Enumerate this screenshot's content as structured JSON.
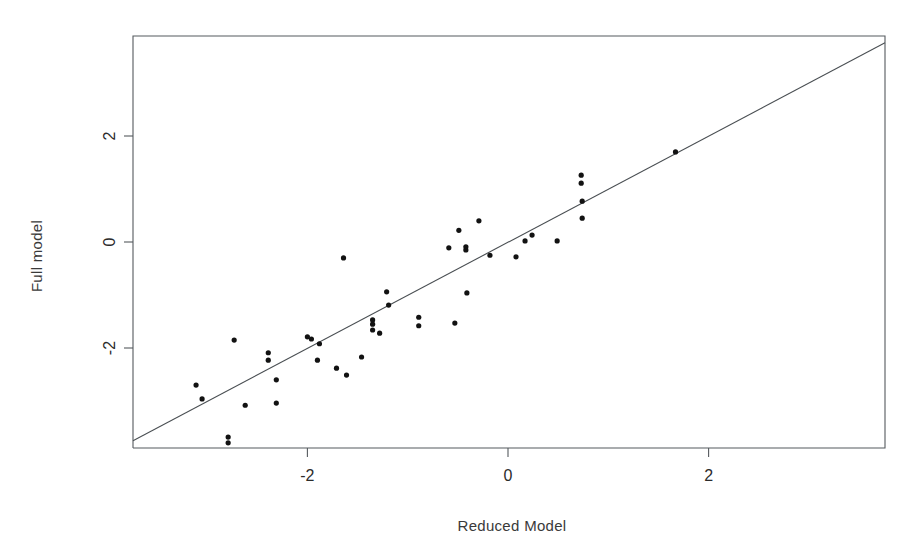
{
  "chart_data": {
    "type": "scatter",
    "title": "",
    "subtitle": "",
    "xlabel": "Reduced Model",
    "ylabel": "Full model",
    "xlim": [
      -3.75,
      3.76
    ],
    "ylim": [
      -3.79,
      3.74
    ],
    "xticks": [
      -2,
      0,
      2
    ],
    "xtick_labels": [
      "-2",
      "0",
      "2"
    ],
    "yticks": [
      -2,
      0,
      2
    ],
    "ytick_labels": [
      "-2",
      "0",
      "2"
    ],
    "grid": false,
    "legend": null,
    "annotations": [],
    "reference_line": {
      "name": "identity-line",
      "type": "line",
      "description": "y = x diagonal reference line",
      "slope": 1,
      "intercept": 0,
      "x_start": -3.75,
      "y_start": -3.75,
      "x_end": 3.76,
      "y_end": 3.76
    },
    "series": [
      {
        "name": "observations",
        "marker": "filled-circle",
        "color": "#121212",
        "points": [
          [
            -3.11,
            -2.7
          ],
          [
            -3.05,
            -2.96
          ],
          [
            -2.73,
            -1.85
          ],
          [
            -2.79,
            -3.68
          ],
          [
            -2.79,
            -3.79
          ],
          [
            -2.62,
            -3.08
          ],
          [
            -2.39,
            -2.09
          ],
          [
            -2.39,
            -2.23
          ],
          [
            -2.31,
            -2.6
          ],
          [
            -2.31,
            -3.04
          ],
          [
            -2.0,
            -1.79
          ],
          [
            -1.96,
            -1.83
          ],
          [
            -1.88,
            -1.92
          ],
          [
            -1.9,
            -2.23
          ],
          [
            -1.71,
            -2.38
          ],
          [
            -1.61,
            -2.51
          ],
          [
            -1.64,
            -0.3
          ],
          [
            -1.46,
            -2.17
          ],
          [
            -1.35,
            -1.47
          ],
          [
            -1.35,
            -1.55
          ],
          [
            -1.35,
            -1.66
          ],
          [
            -1.28,
            -1.72
          ],
          [
            -1.21,
            -0.94
          ],
          [
            -1.19,
            -1.19
          ],
          [
            -0.89,
            -1.42
          ],
          [
            -0.89,
            -1.58
          ],
          [
            -0.53,
            -1.53
          ],
          [
            -0.41,
            -0.96
          ],
          [
            -0.42,
            -0.15
          ],
          [
            -0.42,
            -0.09
          ],
          [
            -0.59,
            -0.11
          ],
          [
            -0.49,
            0.22
          ],
          [
            -0.29,
            0.4
          ],
          [
            -0.18,
            -0.25
          ],
          [
            0.08,
            -0.28
          ],
          [
            0.17,
            0.02
          ],
          [
            0.24,
            0.13
          ],
          [
            0.49,
            0.02
          ],
          [
            0.73,
            1.26
          ],
          [
            0.73,
            1.11
          ],
          [
            0.74,
            0.77
          ],
          [
            0.74,
            0.45
          ],
          [
            1.67,
            1.7
          ]
        ]
      }
    ]
  },
  "layout": {
    "plot_left_px": 133,
    "plot_right_px": 885,
    "plot_top_px": 36,
    "plot_bottom_px": 448,
    "x_zero_px": 508,
    "y_zero_px": 242,
    "x_unit_px": 100.3,
    "y_unit_px": 53,
    "point_radius_px": 2.6,
    "background_color": "#ffffff",
    "frame_color": "#555a5e",
    "point_color": "#121212",
    "line_color": "#4a4f53"
  }
}
